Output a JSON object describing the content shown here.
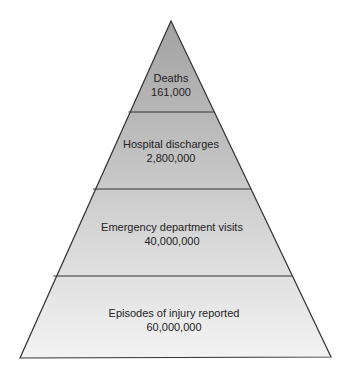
{
  "diagram": {
    "type": "pyramid",
    "colors": {
      "top_fill": "#a6a6a6",
      "bottom_fill": "#f2f2f2",
      "stroke": "#333333",
      "text": "#222222"
    },
    "tiers": [
      {
        "label": "Deaths",
        "value": "161,000"
      },
      {
        "label": "Hospital discharges",
        "value": "2,800,000"
      },
      {
        "label": "Emergency department visits",
        "value": "40,000,000"
      },
      {
        "label": "Episodes of injury reported",
        "value": "60,000,000"
      }
    ]
  }
}
